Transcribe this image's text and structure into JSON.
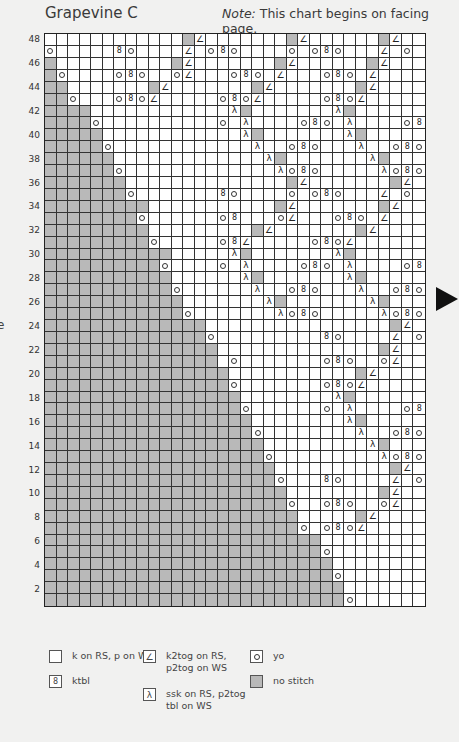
{
  "title": "Grapevine C",
  "note": {
    "label": "Note:",
    "text": " This chart begins on facing page."
  },
  "edge_glyph": "e",
  "chart": {
    "columns": 33,
    "row_count": 48,
    "row_labels": [
      "48",
      "46",
      "44",
      "42",
      "40",
      "38",
      "36",
      "34",
      "32",
      "30",
      "28",
      "26",
      "24",
      "22",
      "20",
      "18",
      "16",
      "14",
      "12",
      "10",
      "8",
      "6",
      "4",
      "2"
    ],
    "symbol_key": {
      ".": "knit",
      "g": "no-stitch",
      "o": "yo",
      "k": "ktbl",
      "/": "k2tog",
      "\\": "ssk"
    },
    "rows_top_to_bottom": [
      "............g/.......g/......g/.",
      "o.....ko..../.oko....o.oko.../.o",
      "g..........g/.......g/......g/..",
      "go....oko..o/...oko./...oko./...",
      "gg.......g/.......g/.......g/...",
      "ggo...oko/.....oko/.....oko/....",
      "gggg............\\g.......\\g......",
      "ggggo..........o.\\....oko.\\....ok",
      "ggggg............\\g.......\\g.....",
      "gggggo............\\..oko...\\..oko",
      "gggggg.............\\g.......\\g...",
      "ggggggo.............\\oko.....\\oko",
      "ggggggg..............g/.......g/.",
      "gggggggo.......ko....o.oko.../.o",
      "ggggggggg...........g/.......g/..",
      "ggggggggo......ok...o/...oko./...",
      "ggggggggg.........g/.......g/...",
      "gggggggggo.....ok/.....oko/.....",
      "ggggggggggg.....\\g.......\\g......",
      "ggggggggggo....o.\\....oko.\\....ok",
      "ggggggggggg......\\g.......\\g.....",
      "gggggggggggo......\\..oko...\\..oko",
      "gggggggggggg.......\\g.......\\g...",
      "ggggggggggggo.......\\oko.....\\oko",
      "gggggggggggggg................g/.",
      "ggggggggggggggo.........ko..../.o",
      "ggggggggggggggg..............g/..",
      "ggggggggggggggg.o.......oko..o/..",
      "gggggggggggggggg...........g/....",
      "ggggggggggggggggo.......oko/.....",
      "ggggggggggggggggg........\\g......",
      "gggggggggggggggggo......o.\\....ok",
      "gggggggggggggggggg........\\g.....",
      "ggggggggggggggggggo........\\..oko",
      "ggggggggggggggggggg.........\\g...",
      "gggggggggggggggggggo.........\\oko",
      "gggggggggggggggggggg..........g/.",
      "ggggggggggggggggggggo...ko..../.o",
      "ggggggggggggggggggggg........g/..",
      "gggggggggggggggggggggo..oko..o/..",
      "gggggggggggggggggggggg.....g/....",
      "ggggggggggggggggggggggo.oko/.....",
      "gggggggggggggggggggggggg.........",
      "ggggggggggggggggggggggggo........",
      "ggggggggggggggggggggggggg........",
      "gggggggggggggggggggggggggo.......",
      "gggggggggggggggggggggggggg.......",
      "ggggggggggggggggggggggggggo......"
    ]
  },
  "legend": [
    {
      "symbol": ".",
      "label": "k on RS, p on WS"
    },
    {
      "symbol": "k",
      "label": "ktbl"
    },
    {
      "symbol": "/",
      "label": "k2tog on RS,\np2tog on WS"
    },
    {
      "symbol": "\\",
      "label": "ssk on RS, p2tog\ntbl on WS"
    },
    {
      "symbol": "o",
      "label": "yo"
    },
    {
      "symbol": "g",
      "label": "no stitch"
    }
  ],
  "colors": {
    "background": "#f1f1f0",
    "no_stitch": "#b9b9b9",
    "grid_line": "#333333",
    "arrow": "#111111"
  },
  "icons": {
    "next_page": "arrow-right-icon"
  }
}
